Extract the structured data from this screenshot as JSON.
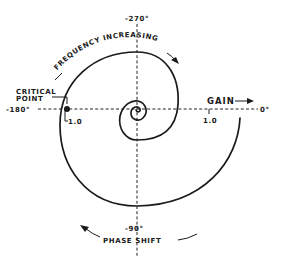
{
  "diagram": {
    "type": "nyquist-plot",
    "axes": {
      "top_label": "-270°",
      "bottom_label": "-90°",
      "left_label": "-180°",
      "right_label": "0°"
    },
    "ticks": {
      "left_tick": "1.0",
      "right_tick": "1.0"
    },
    "annotations": {
      "critical_point_line1": "CRITICAL",
      "critical_point_line2": "POINT",
      "gain": "GAIN",
      "frequency_increasing": "FREQUENCY INCREASING",
      "phase_shift": "PHASE SHIFT"
    },
    "colors": {
      "ink": "#1a1a1a",
      "background": "#ffffff"
    }
  }
}
